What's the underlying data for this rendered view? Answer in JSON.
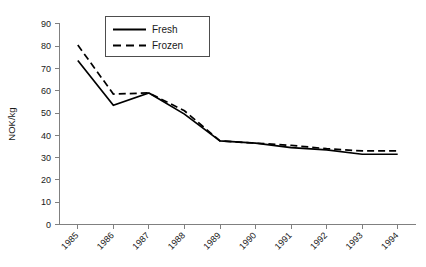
{
  "chart_data": {
    "type": "line",
    "title": "",
    "xlabel": "",
    "ylabel": "NOK/kg",
    "categories": [
      "1985",
      "1986",
      "1987",
      "1988",
      "1989",
      "1990",
      "1991",
      "1992",
      "1993",
      "1994"
    ],
    "series": [
      {
        "name": "Fresh",
        "style": "solid",
        "values": [
          73.5,
          53.5,
          59.0,
          49.5,
          37.5,
          36.5,
          34.5,
          33.5,
          31.5,
          31.5
        ]
      },
      {
        "name": "Frozen",
        "style": "dashed",
        "values": [
          80.5,
          58.5,
          59.0,
          51.0,
          37.5,
          36.5,
          35.5,
          34.0,
          33.0,
          33.0
        ]
      }
    ],
    "ylim": [
      0,
      90
    ],
    "yticks": [
      0,
      10,
      20,
      30,
      40,
      50,
      60,
      70,
      80,
      90
    ],
    "ytick_labels": [
      "0",
      "10",
      "20",
      "30",
      "40",
      "50",
      "60",
      "70",
      "80",
      "90"
    ],
    "xtick_labels": [
      "1985",
      "1986",
      "1987",
      "1988",
      "1989",
      "1990",
      "1991",
      "1992",
      "1993",
      "1994"
    ],
    "grid": false,
    "legend_position": "top-center",
    "legend_entries": [
      "Fresh",
      "Frozen"
    ],
    "colors": {
      "series_line": "#000000",
      "axis": "#808080",
      "text": "#1a1a1a",
      "background": "#ffffff"
    }
  }
}
